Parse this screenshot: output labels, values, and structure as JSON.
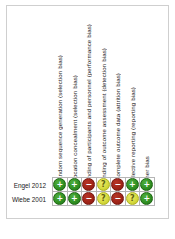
{
  "figure": {
    "type": "risk-of-bias-summary",
    "caption": ""
  },
  "columns": [
    {
      "id": "random-sequence-generation",
      "label": "Random sequence generation (selection bias)"
    },
    {
      "id": "allocation-concealment",
      "label": "Allocation concealment (selection bias)"
    },
    {
      "id": "blinding-participants-personnel",
      "label": "Blinding of participants and personnel (performance bias)"
    },
    {
      "id": "blinding-outcome-assessment",
      "label": "Blinding of outcome assessment (detection bias)"
    },
    {
      "id": "incomplete-outcome-data",
      "label": "Incomplete outcome data (attrition bias)"
    },
    {
      "id": "selective-reporting",
      "label": "Selective reporting (reporting bias)"
    },
    {
      "id": "other-bias",
      "label": "Other bias"
    }
  ],
  "rows": [
    {
      "study": "Engel 2012",
      "judgements": [
        {
          "rating": "low",
          "symbol": "+"
        },
        {
          "rating": "low",
          "symbol": "+"
        },
        {
          "rating": "high",
          "symbol": "−"
        },
        {
          "rating": "unclear",
          "symbol": "?"
        },
        {
          "rating": "high",
          "symbol": "−"
        },
        {
          "rating": "low",
          "symbol": "+"
        },
        {
          "rating": "low",
          "symbol": "+"
        }
      ]
    },
    {
      "study": "Wiebe 2001",
      "judgements": [
        {
          "rating": "low",
          "symbol": "+"
        },
        {
          "rating": "low",
          "symbol": "+"
        },
        {
          "rating": "high",
          "symbol": "−"
        },
        {
          "rating": "unclear",
          "symbol": "?"
        },
        {
          "rating": "high",
          "symbol": "−"
        },
        {
          "rating": "unclear",
          "symbol": "?"
        },
        {
          "rating": "low",
          "symbol": "+"
        }
      ]
    }
  ],
  "colors": {
    "low_risk": "#2f8f22",
    "high_risk": "#9e2317",
    "unclear_risk": "#d5d93c",
    "grid_line": "#b5b5b5",
    "frame": "#cfcfcf",
    "text": "#1a1a1a"
  }
}
